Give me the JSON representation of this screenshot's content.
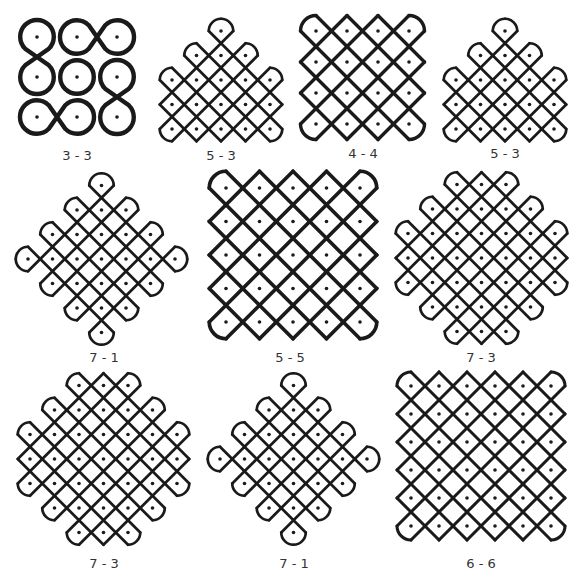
{
  "figure": {
    "stroke_color": "#1a1a1a",
    "dot_color": "#1a1a1a",
    "background": "#ffffff",
    "label_color": "#333333"
  },
  "kolams": [
    {
      "id": "k1",
      "label": "3 - 3",
      "box": [
        20,
        22,
        116,
        118
      ],
      "label_pos": [
        77,
        157
      ],
      "spacing": 40,
      "origin": [
        37,
        37
      ],
      "dots": [
        [
          0,
          0
        ],
        [
          1,
          0
        ],
        [
          2,
          0
        ],
        [
          0,
          1
        ],
        [
          1,
          1
        ],
        [
          2,
          1
        ],
        [
          0,
          2
        ],
        [
          1,
          2
        ],
        [
          2,
          2
        ]
      ],
      "shapes": [
        {
          "type": "eight-v",
          "dots": [
            [
              0,
              0
            ],
            [
              0,
              1
            ]
          ]
        },
        {
          "type": "eight-h",
          "dots": [
            [
              1,
              0
            ],
            [
              2,
              0
            ]
          ]
        },
        {
          "type": "circle",
          "dots": [
            [
              1,
              1
            ]
          ]
        },
        {
          "type": "eight-v",
          "dots": [
            [
              2,
              1
            ],
            [
              2,
              2
            ]
          ]
        },
        {
          "type": "eight-h",
          "dots": [
            [
              0,
              2
            ],
            [
              1,
              2
            ]
          ]
        }
      ]
    },
    {
      "id": "k2",
      "label": "5 - 3",
      "box": [
        160,
        20,
        122,
        122
      ],
      "label_pos": [
        221,
        157
      ],
      "spacing": 24.5,
      "origin": [
        172,
        80
      ],
      "dots": [
        [
          2,
          -2
        ],
        [
          1,
          -1
        ],
        [
          2,
          -1
        ],
        [
          3,
          -1
        ],
        [
          0,
          0
        ],
        [
          1,
          0
        ],
        [
          2,
          0
        ],
        [
          3,
          0
        ],
        [
          4,
          0
        ],
        [
          0,
          1
        ],
        [
          1,
          1
        ],
        [
          2,
          1
        ],
        [
          3,
          1
        ],
        [
          4,
          1
        ],
        [
          0,
          2
        ],
        [
          1,
          2
        ],
        [
          2,
          2
        ],
        [
          3,
          2
        ],
        [
          4,
          2
        ]
      ],
      "shapes": []
    },
    {
      "id": "k3",
      "label": "4 - 4",
      "box": [
        305,
        20,
        120,
        120
      ],
      "label_pos": [
        363,
        155
      ],
      "spacing": 31,
      "origin": [
        316,
        31
      ],
      "dots": [
        [
          0,
          0
        ],
        [
          1,
          0
        ],
        [
          2,
          0
        ],
        [
          3,
          0
        ],
        [
          0,
          1
        ],
        [
          1,
          1
        ],
        [
          2,
          1
        ],
        [
          3,
          1
        ],
        [
          0,
          2
        ],
        [
          1,
          2
        ],
        [
          2,
          2
        ],
        [
          3,
          2
        ],
        [
          0,
          3
        ],
        [
          1,
          3
        ],
        [
          2,
          3
        ],
        [
          3,
          3
        ]
      ],
      "shapes": []
    },
    {
      "id": "k4",
      "label": "5 - 3",
      "box": [
        445,
        20,
        122,
        122
      ],
      "label_pos": [
        505,
        155
      ],
      "spacing": 24.5,
      "origin": [
        456,
        80
      ],
      "dots": [
        [
          2,
          -2
        ],
        [
          1,
          -1
        ],
        [
          2,
          -1
        ],
        [
          3,
          -1
        ],
        [
          0,
          0
        ],
        [
          1,
          0
        ],
        [
          2,
          0
        ],
        [
          3,
          0
        ],
        [
          4,
          0
        ],
        [
          0,
          1
        ],
        [
          1,
          1
        ],
        [
          2,
          1
        ],
        [
          3,
          1
        ],
        [
          4,
          1
        ],
        [
          0,
          2
        ],
        [
          1,
          2
        ],
        [
          2,
          2
        ],
        [
          3,
          2
        ],
        [
          4,
          2
        ]
      ],
      "shapes": []
    },
    {
      "id": "k5",
      "label": "7 - 1",
      "box": [
        20,
        172,
        170,
        170
      ],
      "label_pos": [
        104,
        359
      ],
      "spacing": 24.5,
      "origin": [
        28,
        259
      ],
      "dots": [
        [
          3,
          -3
        ],
        [
          2,
          -2
        ],
        [
          3,
          -2
        ],
        [
          4,
          -2
        ],
        [
          1,
          -1
        ],
        [
          2,
          -1
        ],
        [
          3,
          -1
        ],
        [
          4,
          -1
        ],
        [
          5,
          -1
        ],
        [
          0,
          0
        ],
        [
          1,
          0
        ],
        [
          2,
          0
        ],
        [
          3,
          0
        ],
        [
          4,
          0
        ],
        [
          5,
          0
        ],
        [
          6,
          0
        ],
        [
          1,
          1
        ],
        [
          2,
          1
        ],
        [
          3,
          1
        ],
        [
          4,
          1
        ],
        [
          5,
          1
        ],
        [
          2,
          2
        ],
        [
          3,
          2
        ],
        [
          4,
          2
        ],
        [
          3,
          3
        ]
      ],
      "shapes": []
    },
    {
      "id": "k6",
      "label": "5 - 5",
      "box": [
        213,
        175,
        162,
        162
      ],
      "label_pos": [
        290,
        359
      ],
      "spacing": 33.5,
      "origin": [
        226,
        188
      ],
      "dots": [
        [
          0,
          0
        ],
        [
          1,
          0
        ],
        [
          2,
          0
        ],
        [
          3,
          0
        ],
        [
          4,
          0
        ],
        [
          0,
          1
        ],
        [
          1,
          1
        ],
        [
          2,
          1
        ],
        [
          3,
          1
        ],
        [
          4,
          1
        ],
        [
          0,
          2
        ],
        [
          1,
          2
        ],
        [
          2,
          2
        ],
        [
          3,
          2
        ],
        [
          4,
          2
        ],
        [
          0,
          3
        ],
        [
          1,
          3
        ],
        [
          2,
          3
        ],
        [
          3,
          3
        ],
        [
          4,
          3
        ],
        [
          0,
          4
        ],
        [
          1,
          4
        ],
        [
          2,
          4
        ],
        [
          3,
          4
        ],
        [
          4,
          4
        ]
      ],
      "shapes": []
    },
    {
      "id": "k7",
      "label": "7 - 3",
      "box": [
        400,
        172,
        170,
        170
      ],
      "label_pos": [
        481,
        359
      ],
      "spacing": 24.5,
      "origin": [
        408,
        258
      ],
      "dots": [
        [
          2,
          -3
        ],
        [
          3,
          -3
        ],
        [
          4,
          -3
        ],
        [
          1,
          -2
        ],
        [
          2,
          -2
        ],
        [
          3,
          -2
        ],
        [
          4,
          -2
        ],
        [
          5,
          -2
        ],
        [
          0,
          -1
        ],
        [
          1,
          -1
        ],
        [
          2,
          -1
        ],
        [
          3,
          -1
        ],
        [
          4,
          -1
        ],
        [
          5,
          -1
        ],
        [
          6,
          -1
        ],
        [
          0,
          0
        ],
        [
          1,
          0
        ],
        [
          2,
          0
        ],
        [
          3,
          0
        ],
        [
          4,
          0
        ],
        [
          5,
          0
        ],
        [
          6,
          0
        ],
        [
          0,
          1
        ],
        [
          1,
          1
        ],
        [
          2,
          1
        ],
        [
          3,
          1
        ],
        [
          4,
          1
        ],
        [
          5,
          1
        ],
        [
          6,
          1
        ],
        [
          1,
          2
        ],
        [
          2,
          2
        ],
        [
          3,
          2
        ],
        [
          4,
          2
        ],
        [
          5,
          2
        ],
        [
          2,
          3
        ],
        [
          3,
          3
        ],
        [
          4,
          3
        ]
      ],
      "shapes": []
    },
    {
      "id": "k8",
      "label": "7 - 3",
      "box": [
        20,
        372,
        170,
        175
      ],
      "label_pos": [
        104,
        565
      ],
      "spacing": 24.5,
      "origin": [
        30,
        459
      ],
      "dots": [
        [
          2,
          -3
        ],
        [
          3,
          -3
        ],
        [
          4,
          -3
        ],
        [
          1,
          -2
        ],
        [
          2,
          -2
        ],
        [
          3,
          -2
        ],
        [
          4,
          -2
        ],
        [
          5,
          -2
        ],
        [
          0,
          -1
        ],
        [
          1,
          -1
        ],
        [
          2,
          -1
        ],
        [
          3,
          -1
        ],
        [
          4,
          -1
        ],
        [
          5,
          -1
        ],
        [
          6,
          -1
        ],
        [
          0,
          0
        ],
        [
          1,
          0
        ],
        [
          2,
          0
        ],
        [
          3,
          0
        ],
        [
          4,
          0
        ],
        [
          5,
          0
        ],
        [
          6,
          0
        ],
        [
          0,
          1
        ],
        [
          1,
          1
        ],
        [
          2,
          1
        ],
        [
          3,
          1
        ],
        [
          4,
          1
        ],
        [
          5,
          1
        ],
        [
          6,
          1
        ],
        [
          1,
          2
        ],
        [
          2,
          2
        ],
        [
          3,
          2
        ],
        [
          4,
          2
        ],
        [
          5,
          2
        ],
        [
          2,
          3
        ],
        [
          3,
          3
        ],
        [
          4,
          3
        ]
      ],
      "shapes": []
    },
    {
      "id": "k9",
      "label": "7 - 1",
      "box": [
        212,
        372,
        165,
        175
      ],
      "label_pos": [
        294,
        565
      ],
      "spacing": 24.5,
      "origin": [
        220,
        459
      ],
      "dots": [
        [
          3,
          -3
        ],
        [
          2,
          -2
        ],
        [
          3,
          -2
        ],
        [
          4,
          -2
        ],
        [
          1,
          -1
        ],
        [
          2,
          -1
        ],
        [
          3,
          -1
        ],
        [
          4,
          -1
        ],
        [
          5,
          -1
        ],
        [
          0,
          0
        ],
        [
          1,
          0
        ],
        [
          2,
          0
        ],
        [
          3,
          0
        ],
        [
          4,
          0
        ],
        [
          5,
          0
        ],
        [
          6,
          0
        ],
        [
          1,
          1
        ],
        [
          2,
          1
        ],
        [
          3,
          1
        ],
        [
          4,
          1
        ],
        [
          5,
          1
        ],
        [
          2,
          2
        ],
        [
          3,
          2
        ],
        [
          4,
          2
        ],
        [
          3,
          3
        ]
      ],
      "shapes": []
    },
    {
      "id": "k10",
      "label": "6 - 6",
      "box": [
        400,
        375,
        165,
        165
      ],
      "label_pos": [
        481,
        565
      ],
      "spacing": 28,
      "origin": [
        411,
        386
      ],
      "dots": [
        [
          0,
          0
        ],
        [
          1,
          0
        ],
        [
          2,
          0
        ],
        [
          3,
          0
        ],
        [
          4,
          0
        ],
        [
          5,
          0
        ],
        [
          0,
          1
        ],
        [
          1,
          1
        ],
        [
          2,
          1
        ],
        [
          3,
          1
        ],
        [
          4,
          1
        ],
        [
          5,
          1
        ],
        [
          0,
          2
        ],
        [
          1,
          2
        ],
        [
          2,
          2
        ],
        [
          3,
          2
        ],
        [
          4,
          2
        ],
        [
          5,
          2
        ],
        [
          0,
          3
        ],
        [
          1,
          3
        ],
        [
          2,
          3
        ],
        [
          3,
          3
        ],
        [
          4,
          3
        ],
        [
          5,
          3
        ],
        [
          0,
          4
        ],
        [
          1,
          4
        ],
        [
          2,
          4
        ],
        [
          3,
          4
        ],
        [
          4,
          4
        ],
        [
          5,
          4
        ],
        [
          0,
          5
        ],
        [
          1,
          5
        ],
        [
          2,
          5
        ],
        [
          3,
          5
        ],
        [
          4,
          5
        ],
        [
          5,
          5
        ]
      ],
      "shapes": []
    }
  ]
}
